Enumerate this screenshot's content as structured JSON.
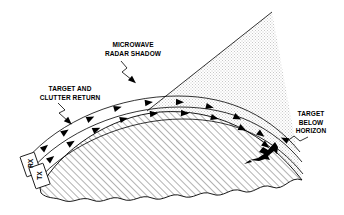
{
  "figure": {
    "type": "technical-diagram",
    "background_color": "#ffffff",
    "line_color": "#000000",
    "shadow_fill_color": "#e8e8e8",
    "earth_hatch_color": "#5a5a5a"
  },
  "labels": {
    "microwave_shadow": "MICROWAVE\nRADAR SHADOW",
    "target_and_clutter": "TARGET AND\nCLUTTER RETURN",
    "target_below_horizon": "TARGET\nBELOW\nHORIZON",
    "rx": "RX",
    "tx": "TX"
  },
  "elements": {
    "radar_site": "radar-site-antennas",
    "aircraft_target": "target-aircraft-silhouette",
    "shadow_wedge": "microwave-radar-shadow-wedge",
    "earth_surface": "curved-earth-terrain",
    "propagation_bands": "radar-beam-propagation-bands",
    "arrow_count_upper": 9,
    "arrow_count_lower": 9
  },
  "leaders": {
    "microwave_leader": "zigzag-leader-down-right",
    "clutter_leader": "zigzag-leader-down-right",
    "target_leader": "zigzag-leader-left"
  }
}
